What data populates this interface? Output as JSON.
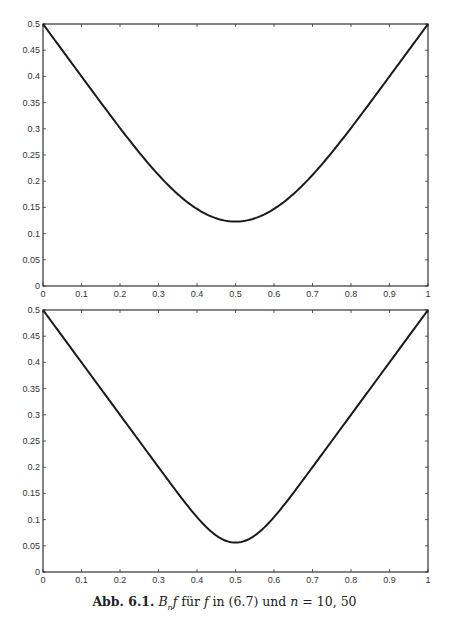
{
  "chart_data": [
    {
      "type": "line",
      "title": "",
      "xlabel": "",
      "ylabel": "",
      "xlim": [
        0,
        1
      ],
      "ylim": [
        0,
        0.5
      ],
      "grid": false,
      "legend": null,
      "xticks": [
        "0",
        "0.1",
        "0.2",
        "0.3",
        "0.4",
        "0.5",
        "0.6",
        "0.7",
        "0.8",
        "0.9",
        "1"
      ],
      "yticks": [
        "0",
        "0.05",
        "0.1",
        "0.15",
        "0.2",
        "0.25",
        "0.3",
        "0.35",
        "0.4",
        "0.45",
        "0.5"
      ],
      "series": [
        {
          "name": "B_10 f",
          "n": 10,
          "x": [
            0,
            0.1,
            0.2,
            0.3,
            0.4,
            0.5,
            0.6,
            0.7,
            0.8,
            0.9,
            1
          ],
          "values": [
            0.5,
            0.401,
            0.306,
            0.222,
            0.157,
            0.123,
            0.157,
            0.222,
            0.306,
            0.401,
            0.5
          ]
        }
      ]
    },
    {
      "type": "line",
      "title": "",
      "xlabel": "",
      "ylabel": "",
      "xlim": [
        0,
        1
      ],
      "ylim": [
        0,
        0.5
      ],
      "grid": false,
      "legend": null,
      "xticks": [
        "0",
        "0.1",
        "0.2",
        "0.3",
        "0.4",
        "0.5",
        "0.6",
        "0.7",
        "0.8",
        "0.9",
        "1"
      ],
      "yticks": [
        "0",
        "0.05",
        "0.1",
        "0.15",
        "0.2",
        "0.25",
        "0.3",
        "0.35",
        "0.4",
        "0.45",
        "0.5"
      ],
      "series": [
        {
          "name": "B_50 f",
          "n": 50,
          "x": [
            0,
            0.1,
            0.2,
            0.3,
            0.4,
            0.5,
            0.6,
            0.7,
            0.8,
            0.9,
            1
          ],
          "values": [
            0.5,
            0.4,
            0.3,
            0.2005,
            0.109,
            0.056,
            0.109,
            0.2005,
            0.3,
            0.4,
            0.5
          ]
        }
      ]
    }
  ],
  "caption": {
    "label": "Abb. 6.1.",
    "text_parts": [
      "B",
      "n",
      "f",
      " für ",
      "f",
      " in (6.7) und ",
      "n",
      " = 10, 50"
    ]
  }
}
